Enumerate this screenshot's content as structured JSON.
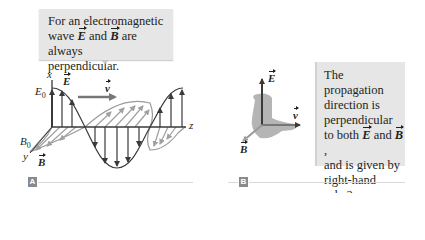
{
  "panel_a": {
    "tag": "A",
    "callout": {
      "line1": "For an electromagnetic",
      "line2_pre": "wave ",
      "vec_e": "E",
      "line2_mid": " and ",
      "vec_b": "B",
      "line2_post": " are always",
      "line3": "perpendicular."
    },
    "labels": {
      "x_axis": "x",
      "z_axis": "z",
      "y_axis": "y",
      "e0": "E",
      "e0_sub": "0",
      "b0": "B",
      "b0_sub": "0",
      "e_vector": "E",
      "b_vector": "B",
      "velocity": "v"
    }
  },
  "panel_b": {
    "tag": "B",
    "labels": {
      "e_vector": "E",
      "b_vector": "B",
      "velocity": "v"
    },
    "infobox": {
      "line1": "The propagation",
      "line2": "direction is",
      "line3": "perpendicular",
      "line4_pre": "to both ",
      "vec_e": "E",
      "line4_mid": " and ",
      "vec_b": "B",
      "line4_post": ",",
      "line5": "and is given by",
      "line6": "right-hand",
      "line7": "rule 2."
    }
  },
  "colors": {
    "box_fill": "#e6e6e6",
    "e_field": "#3a3a3a",
    "b_field": "#9a9a9a",
    "velocity_arrow": "#777777",
    "hand": "#b5b5b5",
    "tag_fill": "#8a8a8a"
  }
}
